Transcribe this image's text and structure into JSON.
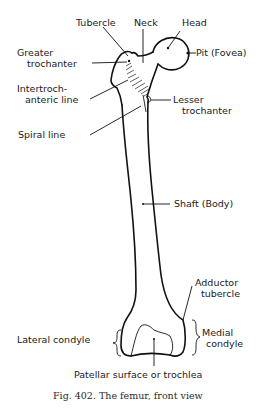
{
  "figure": {
    "caption": "Fig. 402. The femur, front view",
    "subject": "femur",
    "view": "front view"
  },
  "labels": {
    "tubercle": "Tubercle",
    "neck": "Neck",
    "head": "Head",
    "greater_trochanter_1": "Greater",
    "greater_trochanter_2": "trochanter",
    "pit": "Pit (Fovea)",
    "intertrochanteric_1": "Intertroch-",
    "intertrochanteric_2": "anteric line",
    "lesser_trochanter_1": "Lesser",
    "lesser_trochanter_2": "trochanter",
    "spiral_line": "Spiral line",
    "shaft": "Shaft (Body)",
    "adductor_1": "Adductor",
    "adductor_2": "tubercle",
    "lateral_condyle": "Lateral condyle",
    "medial_1": "Medial",
    "medial_2": "condyle",
    "patellar": "Patellar surface or trochlea"
  },
  "colors": {
    "line": "#111111",
    "background": "#ffffff"
  }
}
